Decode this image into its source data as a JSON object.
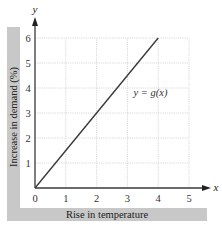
{
  "chart_data": {
    "type": "line",
    "title": "",
    "xlabel": "Rise in temperature",
    "ylabel": "Increase in demand (%)",
    "x_axis_letter": "x",
    "y_axis_letter": "y",
    "x_ticks": [
      "0",
      "1",
      "2",
      "3",
      "4",
      "5"
    ],
    "y_ticks": [
      "1",
      "2",
      "3",
      "4",
      "5",
      "6"
    ],
    "xlim": [
      0,
      5
    ],
    "ylim": [
      0,
      6
    ],
    "grid": true,
    "series": [
      {
        "name": "y = g(x)",
        "x": [
          0,
          4
        ],
        "y": [
          0,
          6
        ]
      }
    ],
    "annotations": [
      {
        "text": "y = g(x)",
        "x": 3.2,
        "y": 3.7
      }
    ]
  },
  "colors": {
    "label_band": "#c8c8c8",
    "axis": "#3a3a3a",
    "line": "#3a3a3a",
    "grid": "#cfcfcf",
    "text": "#333333"
  }
}
